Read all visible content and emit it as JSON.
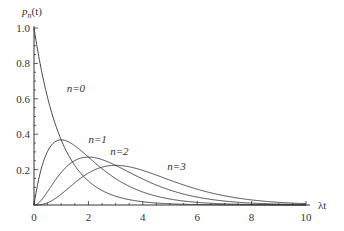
{
  "chart_data": {
    "type": "line",
    "title": "",
    "xlabel": "λt",
    "ylabel": "p_n(t)",
    "xlim": [
      0,
      10
    ],
    "ylim": [
      0,
      1.0
    ],
    "grid": false,
    "legend": "inline labels",
    "x_ticks": [
      0,
      2,
      4,
      6,
      8,
      10
    ],
    "x_tick_labels": [
      "0",
      "2",
      "4",
      "6",
      "8",
      "10"
    ],
    "y_ticks": [
      0.2,
      0.4,
      0.6,
      0.8,
      1.0
    ],
    "y_tick_labels": [
      "0.2",
      "0.4",
      "0.6",
      "0.8",
      "1.0"
    ],
    "formula": "p_n(t) = (λt)^n e^(-λt) / n!",
    "series": [
      {
        "name": "n=0",
        "n": 0,
        "label_x": 1.2,
        "label_y": 0.64,
        "x": [
          0,
          1,
          2,
          3,
          4,
          5,
          6,
          7,
          8,
          9,
          10
        ],
        "values": [
          1.0,
          0.368,
          0.135,
          0.05,
          0.018,
          0.007,
          0.002,
          0.001,
          0.0,
          0.0,
          0.0
        ]
      },
      {
        "name": "n=1",
        "n": 1,
        "label_x": 2.0,
        "label_y": 0.35,
        "x": [
          0,
          1,
          2,
          3,
          4,
          5,
          6,
          7,
          8,
          9,
          10
        ],
        "values": [
          0.0,
          0.368,
          0.271,
          0.149,
          0.073,
          0.034,
          0.015,
          0.006,
          0.003,
          0.001,
          0.0
        ]
      },
      {
        "name": "n=2",
        "n": 2,
        "label_x": 2.8,
        "label_y": 0.28,
        "x": [
          0,
          1,
          2,
          3,
          4,
          5,
          6,
          7,
          8,
          9,
          10
        ],
        "values": [
          0.0,
          0.184,
          0.271,
          0.224,
          0.147,
          0.084,
          0.045,
          0.022,
          0.011,
          0.005,
          0.002
        ]
      },
      {
        "name": "n=3",
        "n": 3,
        "label_x": 4.9,
        "label_y": 0.2,
        "x": [
          0,
          1,
          2,
          3,
          4,
          5,
          6,
          7,
          8,
          9,
          10
        ],
        "values": [
          0.0,
          0.061,
          0.18,
          0.224,
          0.195,
          0.14,
          0.089,
          0.052,
          0.029,
          0.015,
          0.008
        ]
      }
    ]
  },
  "labels": {
    "y_axis": "p",
    "y_axis_sub": "n",
    "y_axis_arg": "(t)",
    "x_axis": "λt",
    "n0": "n=0",
    "n1": "n=1",
    "n2": "n=2",
    "n3": "n=3"
  },
  "style": {
    "curve_color": "#333333",
    "axis_color": "#333333"
  }
}
